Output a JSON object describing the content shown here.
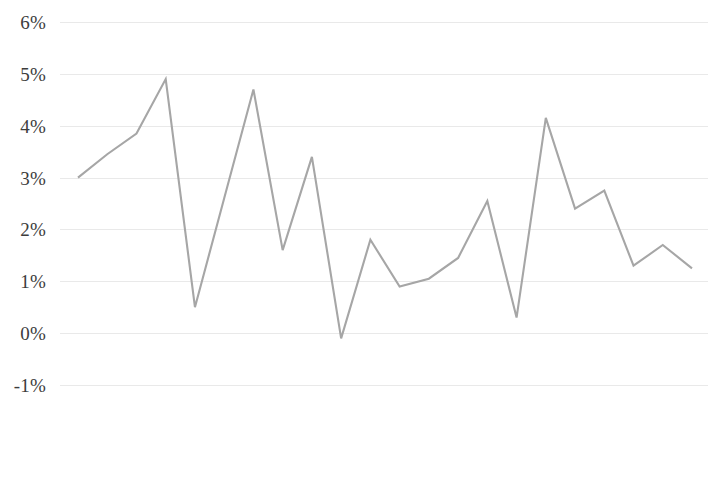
{
  "chart_data": {
    "type": "line",
    "title": "",
    "subtitle": "",
    "xlabel": "",
    "ylabel": "",
    "grid": true,
    "legend": "none",
    "ylim": [
      -1,
      6
    ],
    "y_tick_labels": [
      "6%",
      "5%",
      "4%",
      "3%",
      "2%",
      "1%",
      "0%",
      "-1%"
    ],
    "y_tick_values": [
      6,
      5,
      4,
      3,
      2,
      1,
      0,
      -1
    ],
    "categories": [
      "Jun-1996",
      "Jun-1997",
      "Jun-1998",
      "Jun-1999",
      "Jun-2000",
      "Jun-2001",
      "Jun-2002",
      "Jun-2003",
      "Jun-2004",
      "Jun-2005",
      "Jun-2006",
      "Jun-2007",
      "Jun-2008",
      "Jun-2009",
      "Jun-2010",
      "Jun-2011",
      "Jun-2012",
      "Jun-2013",
      "Jun-2014",
      "Jun-2015",
      "Jun-2016",
      "Jun-2017"
    ],
    "series": [
      {
        "name": "",
        "color": "#a6a6a6",
        "values": [
          3.0,
          3.45,
          3.85,
          4.9,
          0.5,
          2.6,
          4.7,
          1.6,
          3.4,
          -0.1,
          1.8,
          0.9,
          1.05,
          1.45,
          2.55,
          0.3,
          4.15,
          2.4,
          2.75,
          1.3,
          1.7,
          1.25
        ]
      }
    ]
  },
  "style": {
    "line_color": "#a6a6a6",
    "grid_color": "#e9e9e9",
    "text_color": "#3c3c3c",
    "background": "#ffffff"
  }
}
